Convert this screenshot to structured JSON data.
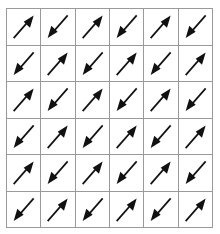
{
  "figure": {
    "title": "",
    "type": "arrow-direction-grid",
    "rows": 6,
    "columns": 6,
    "background_color": "#ffffff",
    "grid_line_color": "#9a9a9a",
    "arrow_color": "#111111",
    "arrow_icon_names": {
      "NE": "arrow-northeast-icon",
      "SW": "arrow-southwest-icon"
    },
    "cells": [
      [
        {
          "direction": "NE",
          "angle_deg": 45
        },
        {
          "direction": "SW",
          "angle_deg": 225
        },
        {
          "direction": "NE",
          "angle_deg": 45
        },
        {
          "direction": "SW",
          "angle_deg": 225
        },
        {
          "direction": "NE",
          "angle_deg": 45
        },
        {
          "direction": "SW",
          "angle_deg": 225
        }
      ],
      [
        {
          "direction": "SW",
          "angle_deg": 225
        },
        {
          "direction": "NE",
          "angle_deg": 45
        },
        {
          "direction": "SW",
          "angle_deg": 225
        },
        {
          "direction": "NE",
          "angle_deg": 45
        },
        {
          "direction": "SW",
          "angle_deg": 225
        },
        {
          "direction": "NE",
          "angle_deg": 45
        }
      ],
      [
        {
          "direction": "NE",
          "angle_deg": 45
        },
        {
          "direction": "SW",
          "angle_deg": 225
        },
        {
          "direction": "NE",
          "angle_deg": 45
        },
        {
          "direction": "SW",
          "angle_deg": 225
        },
        {
          "direction": "NE",
          "angle_deg": 45
        },
        {
          "direction": "SW",
          "angle_deg": 225
        }
      ],
      [
        {
          "direction": "SW",
          "angle_deg": 225
        },
        {
          "direction": "NE",
          "angle_deg": 45
        },
        {
          "direction": "SW",
          "angle_deg": 225
        },
        {
          "direction": "NE",
          "angle_deg": 45
        },
        {
          "direction": "SW",
          "angle_deg": 225
        },
        {
          "direction": "NE",
          "angle_deg": 45
        }
      ],
      [
        {
          "direction": "NE",
          "angle_deg": 45
        },
        {
          "direction": "SW",
          "angle_deg": 225
        },
        {
          "direction": "NE",
          "angle_deg": 45
        },
        {
          "direction": "SW",
          "angle_deg": 225
        },
        {
          "direction": "NE",
          "angle_deg": 45
        },
        {
          "direction": "SW",
          "angle_deg": 225
        }
      ],
      [
        {
          "direction": "SW",
          "angle_deg": 225
        },
        {
          "direction": "NE",
          "angle_deg": 45
        },
        {
          "direction": "SW",
          "angle_deg": 225
        },
        {
          "direction": "NE",
          "angle_deg": 45
        },
        {
          "direction": "SW",
          "angle_deg": 225
        },
        {
          "direction": "NE",
          "angle_deg": 45
        }
      ]
    ]
  }
}
